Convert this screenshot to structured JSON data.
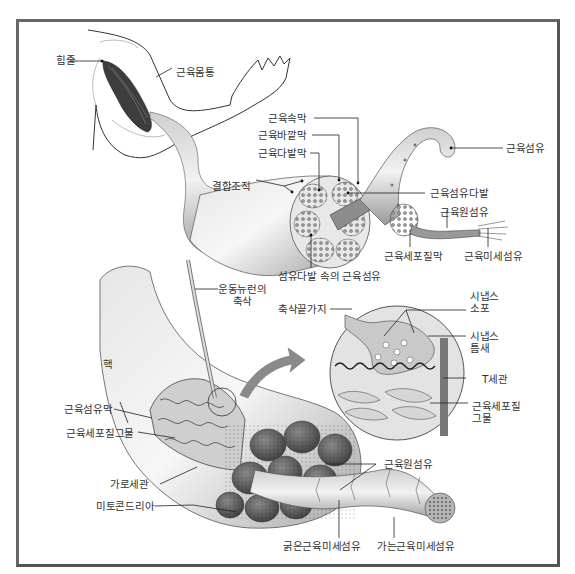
{
  "diagram": {
    "colors": {
      "frame": "#5a5a5a",
      "ink": "#333333",
      "muscle_dark": "#3a3a3a",
      "muscle_mid": "#8a8a8a",
      "muscle_light": "#d6d6d6",
      "line": "#222222"
    },
    "top_section": {
      "labels": {
        "tendon": "힘줄",
        "muscle_belly": "근육몸통",
        "epimysium": "근육속막",
        "perimysium": "근육바깥막",
        "fascicle_membrane": "근육다발막",
        "connective_tissue": "결합조직",
        "muscle_fiber": "근육섬유",
        "muscle_fiber_bundle": "근육섬유다발",
        "myofibril": "근육원섬유",
        "sarcolemma": "근육세포질막",
        "myofilament": "근육미세섬유",
        "fibers_in_bundle": "섬유다발 속의 근육섬유"
      }
    },
    "bottom_section": {
      "labels": {
        "motor_neuron_axon_1": "운동뉴런의",
        "motor_neuron_axon_2": "축삭",
        "axon_terminal": "축삭끝가지",
        "synaptic_vesicle_1": "시냅스",
        "synaptic_vesicle_2": "소포",
        "synaptic_cleft_1": "시냅스",
        "synaptic_cleft_2": "틈새",
        "t_tubule": "T세관",
        "sr_1": "근육세포질",
        "sr_2": "그물",
        "nucleus": "핵",
        "endomysium": "근육섬유막",
        "sarcoplasmic_reticulum": "근육세포질그물",
        "transverse_tubule": "가로세관",
        "mitochondria": "미토콘드리아",
        "myofibril": "근육원섬유",
        "thick_filament": "굵은근육미세섬유",
        "thin_filament": "가는근육미세섬유"
      }
    }
  }
}
